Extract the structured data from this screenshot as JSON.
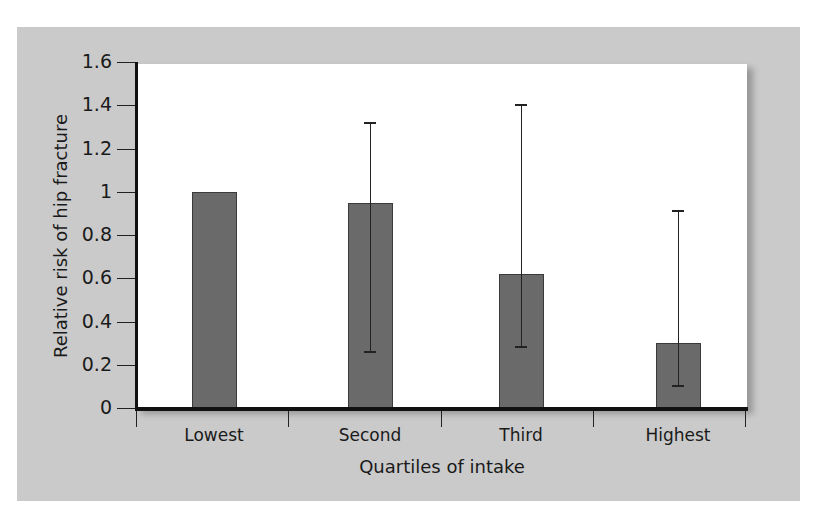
{
  "chart_data": {
    "type": "bar",
    "title": "",
    "xlabel": "Quartiles of intake",
    "ylabel": "Relative risk of hip fracture",
    "categories": [
      "Lowest",
      "Second",
      "Third",
      "Highest"
    ],
    "values": [
      1.0,
      0.95,
      0.62,
      0.3
    ],
    "error_bars": {
      "lower": [
        null,
        0.26,
        0.28,
        0.1
      ],
      "upper": [
        null,
        1.32,
        1.4,
        0.91
      ]
    },
    "ylim": [
      0,
      1.6
    ],
    "yticks": [
      "0",
      "0.2",
      "0.4",
      "0.6",
      "0.8",
      "1",
      "1.2",
      "1.4",
      "1.6"
    ],
    "grid": false,
    "legend": null,
    "colors": {
      "bar": "#6a6a6a",
      "panel_background": "#cacaca",
      "plot_background": "#ffffff"
    }
  }
}
